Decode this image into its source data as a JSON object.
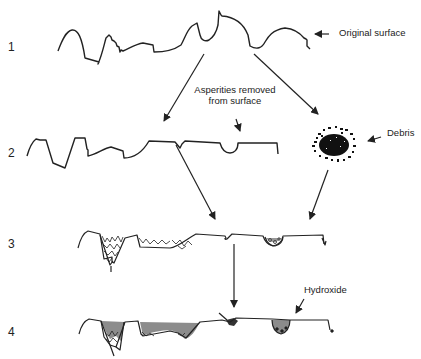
{
  "diagram": {
    "type": "process-flow",
    "colors": {
      "line": "#222222",
      "hydroxide_fill": "#8c8c8c",
      "background": "#ffffff"
    },
    "stages": [
      {
        "number": "1",
        "description": "rough surface profile"
      },
      {
        "number": "2",
        "description": "surface with asperities removed"
      },
      {
        "number": "3",
        "description": "surface valleys filled with debris"
      },
      {
        "number": "4",
        "description": "valleys filled with debris and hydroxide"
      }
    ],
    "annotations": {
      "original_surface": "Original surface",
      "asperities_line1": "Asperities removed",
      "asperities_line2": "from surface",
      "debris": "Debris",
      "hydroxide": "Hydroxide"
    },
    "connections": [
      {
        "from": "stage-1",
        "to": "stage-2"
      },
      {
        "from": "stage-1",
        "to": "debris"
      },
      {
        "from": "stage-2",
        "to": "stage-3"
      },
      {
        "from": "debris",
        "to": "stage-3"
      },
      {
        "from": "stage-3",
        "to": "stage-4"
      }
    ]
  }
}
